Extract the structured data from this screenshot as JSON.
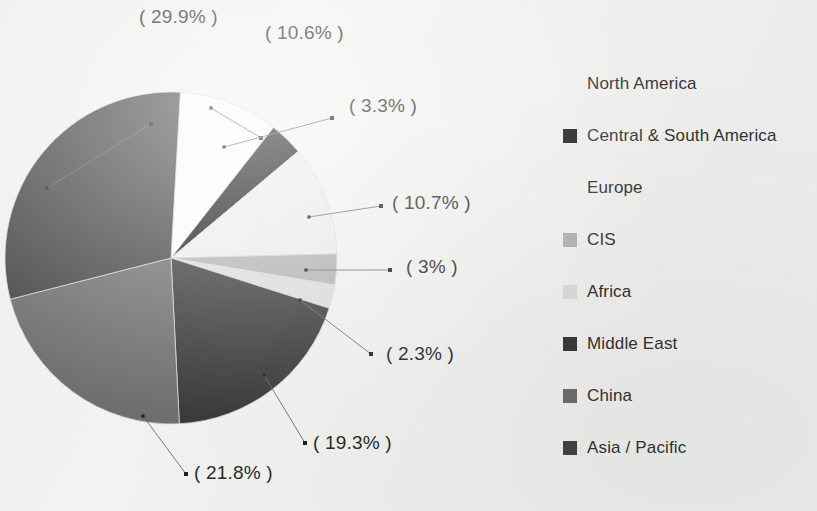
{
  "page": {
    "background_color": "#f2f2f0",
    "text_color": "#2b2b2b"
  },
  "chart_data": {
    "type": "pie",
    "title": "",
    "subtitle": "",
    "xlabel": "",
    "ylabel": "",
    "grid": false,
    "legend_position": "right",
    "label_format": "( {value}% )",
    "center": {
      "x": 171,
      "y": 258
    },
    "radius": 166,
    "start_angle_deg": 0,
    "direction": "clockwise",
    "categories": [
      "North America",
      "Central & South America",
      "Europe",
      "CIS",
      "Africa",
      "Middle East",
      "China",
      "Asia / Pacific"
    ],
    "values": [
      10.6,
      3.3,
      10.7,
      3,
      2.3,
      19.3,
      21.8,
      29.9
    ],
    "colors": [
      "#fbfbfa",
      "#1c1c1c",
      "#ececea",
      "#b2b2b0",
      "#dcdcda",
      "#3a3a3a",
      "#6e6e6e",
      "#454545"
    ],
    "slices": [
      {
        "name": "North America",
        "value": 10.6,
        "label": "( 10.6% )",
        "color": "#fbfbfa",
        "start_deg": 0,
        "end_deg": 38.16
      },
      {
        "name": "Central & South America",
        "value": 3.3,
        "label": "( 3.3% )",
        "color": "#1c1c1c",
        "start_deg": 38.16,
        "end_deg": 50.04
      },
      {
        "name": "Europe",
        "value": 10.7,
        "label": "( 10.7% )",
        "color": "#ececea",
        "start_deg": 50.04,
        "end_deg": 88.56
      },
      {
        "name": "CIS",
        "value": 3,
        "label": "( 3% )",
        "color": "#b2b2b0",
        "start_deg": 88.56,
        "end_deg": 99.36
      },
      {
        "name": "Africa",
        "value": 2.3,
        "label": "( 2.3% )",
        "color": "#dcdcda",
        "start_deg": 99.36,
        "end_deg": 107.64
      },
      {
        "name": "Middle East",
        "value": 19.3,
        "label": "( 19.3% )",
        "color": "#3a3a3a",
        "start_deg": 107.64,
        "end_deg": 177.12
      },
      {
        "name": "China",
        "value": 21.8,
        "label": "( 21.8% )",
        "color": "#6e6e6e",
        "start_deg": 177.12,
        "end_deg": 255.6
      },
      {
        "name": "Asia / Pacific",
        "value": 29.9,
        "label": "( 29.9% )",
        "color": "#454545",
        "start_deg": 255.6,
        "end_deg": 363.24
      }
    ]
  },
  "callouts": [
    {
      "id": "asia-pacific",
      "text": "( 29.9% )",
      "x": 139,
      "y": 6,
      "dot": {
        "x": 151,
        "y": 124
      },
      "anchor": {
        "x": 47,
        "y": 188
      }
    },
    {
      "id": "north-america",
      "text": "( 10.6% )",
      "x": 265,
      "y": 22,
      "dot": {
        "x": 261,
        "y": 138
      },
      "anchor": {
        "x": 211,
        "y": 108
      }
    },
    {
      "id": "central-south",
      "text": "( 3.3% )",
      "x": 349,
      "y": 95,
      "dot": {
        "x": 332,
        "y": 118
      },
      "anchor": {
        "x": 224,
        "y": 147
      }
    },
    {
      "id": "europe",
      "text": "( 10.7% )",
      "x": 392,
      "y": 192,
      "dot": {
        "x": 381,
        "y": 206
      },
      "anchor": {
        "x": 309,
        "y": 217
      }
    },
    {
      "id": "cis",
      "text": "( 3% )",
      "x": 406,
      "y": 256,
      "dot": {
        "x": 390,
        "y": 270
      },
      "anchor": {
        "x": 306,
        "y": 270
      }
    },
    {
      "id": "africa",
      "text": "( 2.3% )",
      "x": 386,
      "y": 343,
      "dot": {
        "x": 371,
        "y": 354
      },
      "anchor": {
        "x": 300,
        "y": 300
      }
    },
    {
      "id": "middle-east",
      "text": "( 19.3% )",
      "x": 313,
      "y": 432,
      "dot": {
        "x": 305,
        "y": 443
      },
      "anchor": {
        "x": 264,
        "y": 375
      }
    },
    {
      "id": "china",
      "text": "( 21.8% )",
      "x": 194,
      "y": 462,
      "dot": {
        "x": 186,
        "y": 474
      },
      "anchor": {
        "x": 143,
        "y": 416
      }
    }
  ],
  "legend": {
    "items": [
      {
        "label": "North America",
        "color": "#fbfbfa",
        "swatch_visible": false
      },
      {
        "label": "Central & South America",
        "color": "#1c1c1c",
        "swatch_visible": true
      },
      {
        "label": "Europe",
        "color": "#ececea",
        "swatch_visible": false
      },
      {
        "label": "CIS",
        "color": "#b2b2b0",
        "swatch_visible": true
      },
      {
        "label": "Africa",
        "color": "#dcdcda",
        "swatch_visible": true
      },
      {
        "label": "Middle East",
        "color": "#3a3a3a",
        "swatch_visible": true
      },
      {
        "label": "China",
        "color": "#6e6e6e",
        "swatch_visible": true
      },
      {
        "label": "Asia / Pacific",
        "color": "#454545",
        "swatch_visible": true
      }
    ]
  }
}
